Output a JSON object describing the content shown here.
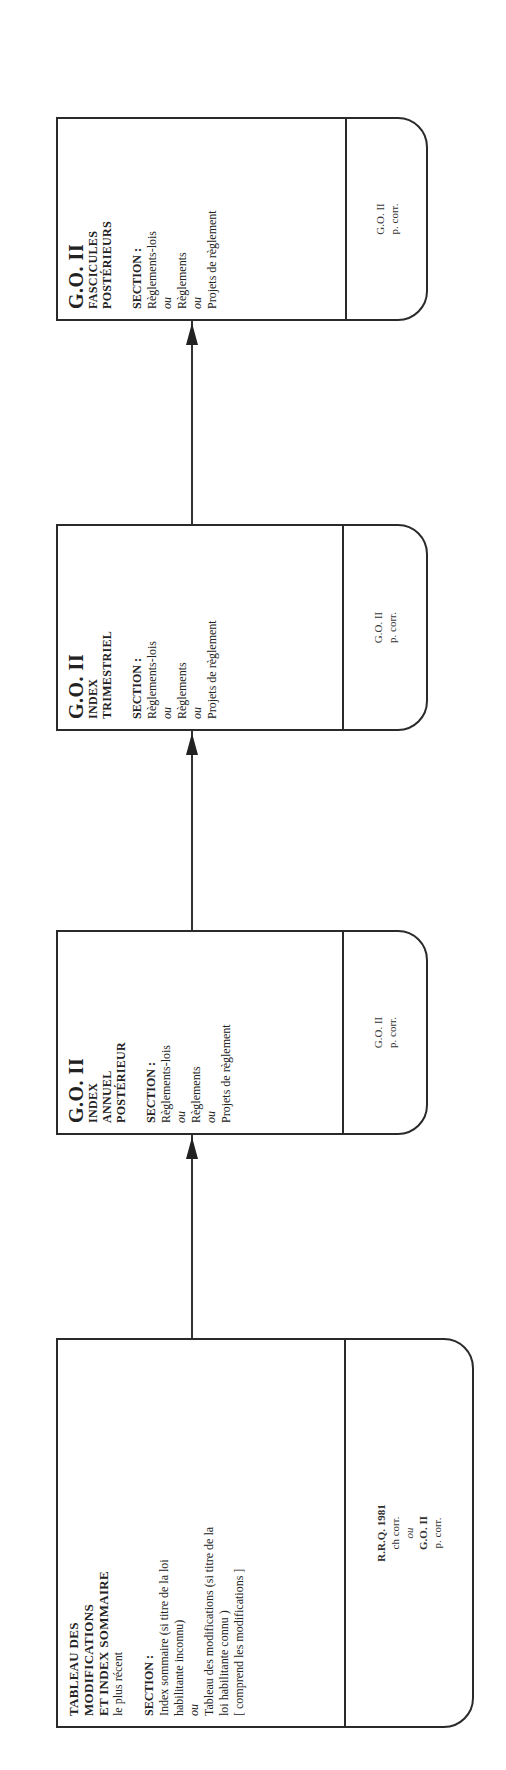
{
  "diagram": {
    "orientation": "rotated -90deg (text reads bottom-to-top)",
    "flow_direction": "left-to-right in reading orientation (bottom to top on page)",
    "boxes": [
      {
        "id": "tableau",
        "title_lines": [
          "TABLEAU DES",
          "MODIFICATIONS",
          "ET INDEX SOMMAIRE"
        ],
        "qualifier": "le plus récent",
        "section_label": "SECTION :",
        "section_items": [
          {
            "text": "Index sommaire (si titre de la loi",
            "style": "plain"
          },
          {
            "text": "habilitante inconnu)",
            "style": "plain"
          },
          {
            "text": "ou",
            "style": "italic"
          },
          {
            "text": "Tableau des modifications (si titre de la",
            "style": "plain"
          },
          {
            "text": "loi habilitante connu )",
            "style": "plain"
          },
          {
            "text": "[ comprend les modifications ]",
            "style": "plain"
          }
        ],
        "tab_lines": [
          {
            "text": "R.R.Q. 1981",
            "style": "bold"
          },
          {
            "text": "ch corr.",
            "style": "plain"
          },
          {
            "text": "ou",
            "style": "italic"
          },
          {
            "text": "G.O. II",
            "style": "bold"
          },
          {
            "text": "p. corr.",
            "style": "plain"
          }
        ]
      },
      {
        "id": "annuel",
        "title_big": "G.O. II",
        "subtitle_lines": [
          "INDEX",
          "ANNUEL",
          "POSTÉRIEUR"
        ],
        "section_label": "SECTION :",
        "section_items": [
          {
            "text": "Règlements-lois",
            "style": "plain"
          },
          {
            "text": "ou",
            "style": "italic"
          },
          {
            "text": "Règlements",
            "style": "plain"
          },
          {
            "text": "ou",
            "style": "italic"
          },
          {
            "text": "Projets de règlement",
            "style": "plain"
          }
        ],
        "tab_lines": [
          {
            "text": "G.O. II",
            "style": "plain"
          },
          {
            "text": "p. corr.",
            "style": "plain"
          }
        ]
      },
      {
        "id": "trimestriel",
        "title_big": "G.O. II",
        "subtitle_lines": [
          "INDEX",
          "TRIMESTRIEL"
        ],
        "section_label": "SECTION :",
        "section_items": [
          {
            "text": "Règlements-lois",
            "style": "plain"
          },
          {
            "text": "ou",
            "style": "italic"
          },
          {
            "text": "Règlements",
            "style": "plain"
          },
          {
            "text": "ou",
            "style": "italic"
          },
          {
            "text": "Projets de règlement",
            "style": "plain"
          }
        ],
        "tab_lines": [
          {
            "text": "G.O. II",
            "style": "plain"
          },
          {
            "text": "p. corr.",
            "style": "plain"
          }
        ]
      },
      {
        "id": "fascicules",
        "title_big": "G.O. II",
        "subtitle_lines": [
          "FASCICULES",
          "POSTÉRIEURS"
        ],
        "section_label": "SECTION :",
        "section_items": [
          {
            "text": "Règlements-lois",
            "style": "plain"
          },
          {
            "text": "ou",
            "style": "italic"
          },
          {
            "text": "Règlements",
            "style": "plain"
          },
          {
            "text": "ou",
            "style": "italic"
          },
          {
            "text": "Projets de règlement",
            "style": "plain"
          }
        ],
        "tab_lines": [
          {
            "text": "G.O. II",
            "style": "plain"
          },
          {
            "text": "p. corr.",
            "style": "plain"
          }
        ]
      }
    ],
    "arrows": [
      {
        "from": "tableau",
        "to": "annuel"
      },
      {
        "from": "annuel",
        "to": "trimestriel"
      },
      {
        "from": "trimestriel",
        "to": "fascicules"
      }
    ],
    "colors": {
      "line": "#2a2a2a",
      "text": "#222222",
      "background": "#ffffff"
    }
  }
}
